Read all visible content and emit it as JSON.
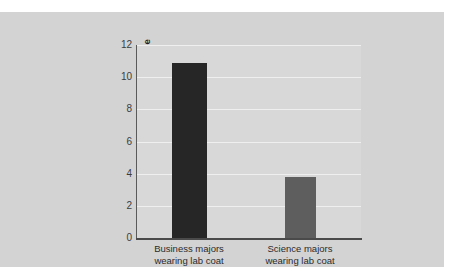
{
  "chart_data": {
    "type": "bar",
    "title": "",
    "subtitle": "",
    "xlabel": "",
    "ylabel": "Evaluation of the chosen album after the decision",
    "ylabel_lines": [
      "Evaluation of the chosen album",
      "after the decision"
    ],
    "categories": [
      "Business majors wearing lab coat",
      "Science majors wearing lab coat"
    ],
    "category_lines": [
      [
        "Business majors",
        "wearing lab coat"
      ],
      [
        "Science majors",
        "wearing lab coat"
      ]
    ],
    "values": [
      10.9,
      3.8
    ],
    "ylim": [
      0,
      12
    ],
    "yticks": [
      0,
      2,
      4,
      6,
      8,
      10,
      12
    ],
    "ytick_labels": [
      "0",
      "2",
      "4",
      "6",
      "8",
      "10",
      "12"
    ],
    "grid": true,
    "grid_axis": "y",
    "legend": false,
    "legend_position": "none",
    "bar_colors": [
      "#262626",
      "#5e5e5e"
    ],
    "colors": {
      "figure_background": "#d3d3d3",
      "plot_background": "#d8d8d8",
      "gridline": "#efefef",
      "axis": "#4a4a4a",
      "tick_text": "#3c3c3c",
      "category_text": "#2b2b2b",
      "axis_title_text": "#1e1e1e",
      "page_background": "#ffffff"
    }
  }
}
